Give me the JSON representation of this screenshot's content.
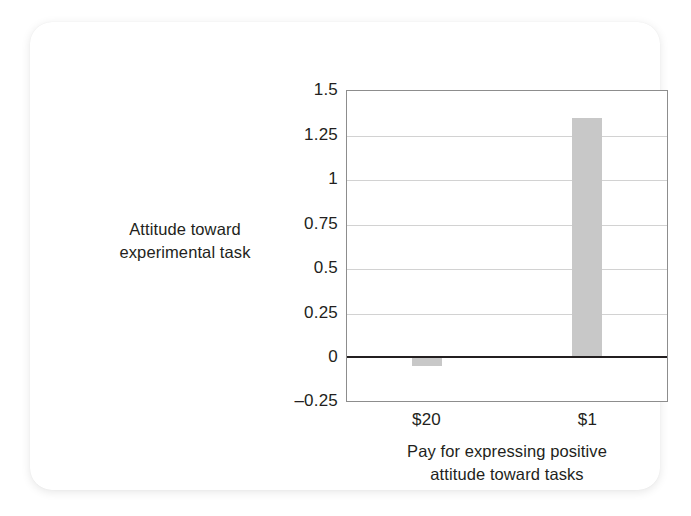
{
  "chart_data": {
    "type": "bar",
    "title": "",
    "subtitle": "",
    "xlabel": "Pay for expressing positive attitude toward tasks",
    "xlabel_line1": "Pay for expressing positive",
    "xlabel_line2": "attitude toward tasks",
    "ylabel": "Attitude toward experimental task",
    "ylabel_line1": "Attitude toward",
    "ylabel_line2": "experimental task",
    "categories": [
      "$20",
      "$1"
    ],
    "values": [
      -0.05,
      1.35
    ],
    "series": [
      {
        "name": "Attitude toward experimental task",
        "values": [
          -0.05,
          1.35
        ]
      }
    ],
    "ylim": [
      -0.25,
      1.5
    ],
    "yticks": [
      1.5,
      1.25,
      1,
      0.75,
      0.5,
      0.25,
      0,
      -0.25
    ],
    "ytick_labels": [
      "1.5",
      "1.25",
      "1",
      "0.75",
      "0.5",
      "0.25",
      "0",
      "–0.25"
    ],
    "grid": true,
    "legend": "none",
    "bar_color": "#c8c8c8",
    "zero_line_color": "#231f20",
    "grid_color": "#d2d2d2",
    "frame_color": "#8d8d8d",
    "text_color": "#231f20",
    "card_background": "#ffffff",
    "page_background": "#ffffff"
  }
}
